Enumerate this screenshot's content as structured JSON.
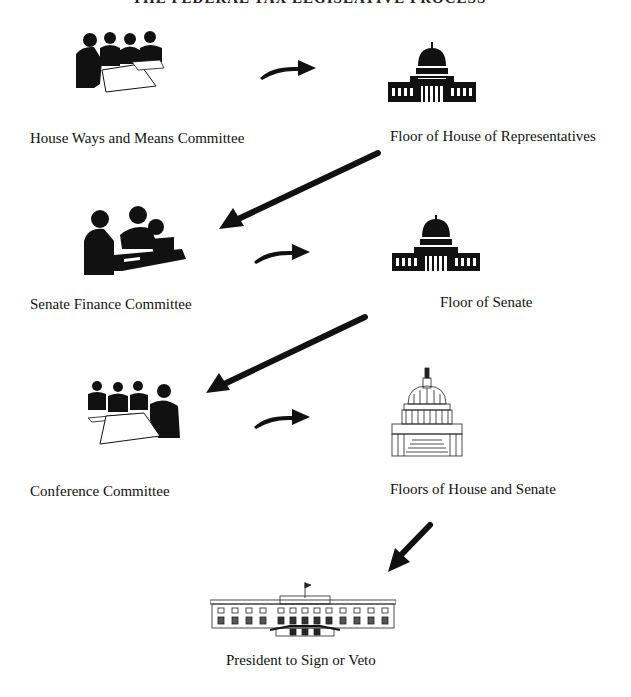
{
  "title": "THE FEDERAL TAX LEGISLATIVE PROCESS",
  "steps": [
    {
      "label": "House Ways and Means Committee",
      "icon": "committee-meeting-icon"
    },
    {
      "label": "Floor of House of Representatives",
      "icon": "capitol-building-icon"
    },
    {
      "label": "Senate Finance Committee",
      "icon": "committee-meeting-icon"
    },
    {
      "label": "Floor of Senate",
      "icon": "capitol-building-icon"
    },
    {
      "label": "Conference Committee",
      "icon": "committee-meeting-icon"
    },
    {
      "label": "Floors of House and Senate",
      "icon": "capitol-dome-icon"
    },
    {
      "label": "President to Sign or Veto",
      "icon": "white-house-icon"
    }
  ],
  "colors": {
    "ink": "#111111",
    "paper": "#ffffff"
  }
}
